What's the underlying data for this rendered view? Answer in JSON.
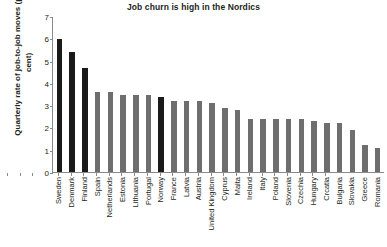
{
  "chart_data": {
    "type": "bar",
    "title": "Job churn is high in the Nordics",
    "xlabel": "",
    "ylabel": "Quarterly rate of job-to-job moves (per cent)",
    "ylim": [
      0,
      7
    ],
    "yticks": [
      0,
      1,
      2,
      3,
      4,
      5,
      6,
      7
    ],
    "grid": false,
    "legend": "none",
    "highlight_color": "#1a1a1a",
    "bar_color": "#6e6e6e",
    "highlight_note": "Nordic countries shown in black",
    "categories": [
      "Sweden",
      "Denmark",
      "Finland",
      "Spain",
      "Netherlands",
      "Estonia",
      "Lithuania",
      "Portugal",
      "Norway",
      "France",
      "Latvia",
      "Austria",
      "United Kingdom",
      "Cyprus",
      "Malta",
      "Ireland",
      "Italy",
      "Poland",
      "Slovenia",
      "Czechia",
      "Hungary",
      "Crcatia",
      "Bulgaria",
      "Slovakia",
      "Greece",
      "Romania"
    ],
    "values": [
      6.0,
      5.4,
      4.7,
      3.6,
      3.6,
      3.5,
      3.5,
      3.5,
      3.4,
      3.2,
      3.2,
      3.2,
      3.1,
      2.9,
      2.8,
      2.4,
      2.4,
      2.4,
      2.4,
      2.4,
      2.3,
      2.2,
      2.2,
      1.9,
      1.2,
      1.1
    ],
    "highlight": [
      true,
      true,
      true,
      false,
      false,
      false,
      false,
      false,
      true,
      false,
      false,
      false,
      false,
      false,
      false,
      false,
      false,
      false,
      false,
      false,
      false,
      false,
      false,
      false,
      false,
      false
    ]
  }
}
